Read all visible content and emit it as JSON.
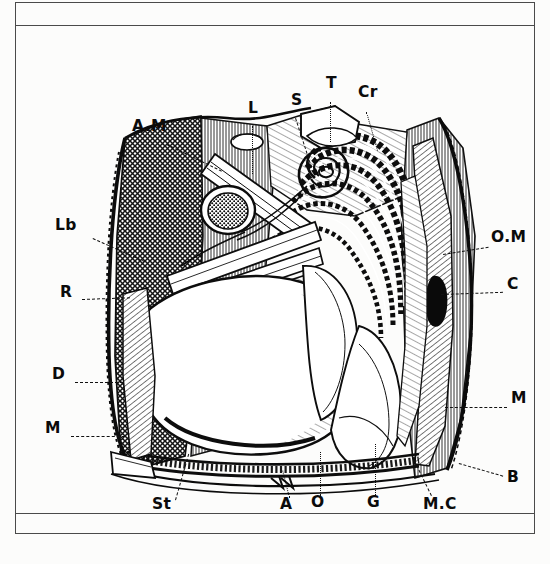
{
  "page": {
    "kind": "scanned-plate",
    "background_color": "#fcfcfb",
    "ink_color": "#111111",
    "rule_color": "#4a4a4a"
  },
  "figure": {
    "title": "",
    "caption": "",
    "style": "black-and-white line engraving with cross-hatching"
  },
  "labels": [
    {
      "id": "AM",
      "text": "A.M",
      "x": 117,
      "y": 100,
      "lx": 152,
      "ly": 118,
      "tx": 203,
      "ty": 148
    },
    {
      "id": "L",
      "text": "L",
      "x": 233,
      "y": 82,
      "lx": 238,
      "ly": 100,
      "tx": 238,
      "ty": 148
    },
    {
      "id": "S",
      "text": "S",
      "x": 276,
      "y": 74,
      "lx": 281,
      "ly": 92,
      "tx": 293,
      "ty": 142
    },
    {
      "id": "T",
      "text": "T",
      "x": 311,
      "y": 57,
      "lx": 316,
      "ly": 76,
      "tx": 316,
      "ty": 116
    },
    {
      "id": "Cr",
      "text": "Cr",
      "x": 344,
      "y": 66,
      "lx": 352,
      "ly": 86,
      "tx": 362,
      "ty": 124
    },
    {
      "id": "Lb",
      "text": "Lb",
      "x": 45,
      "y": 199,
      "lx": 78,
      "ly": 212,
      "tx": 133,
      "ty": 235
    },
    {
      "id": "R",
      "text": "R",
      "x": 49,
      "y": 266,
      "lx": 67,
      "ly": 275,
      "tx": 115,
      "ty": 272
    },
    {
      "id": "D",
      "text": "D",
      "x": 41,
      "y": 347,
      "lx": 60,
      "ly": 356,
      "tx": 108,
      "ty": 356
    },
    {
      "id": "M_L",
      "text": "M",
      "x": 33,
      "y": 401,
      "lx": 56,
      "ly": 410,
      "tx": 110,
      "ty": 410
    },
    {
      "id": "OM",
      "text": "O.M",
      "x": 478,
      "y": 212,
      "lx": 430,
      "ly": 228,
      "tx": 473,
      "ty": 221
    },
    {
      "id": "C",
      "text": "C",
      "x": 494,
      "y": 258,
      "lx": 428,
      "ly": 268,
      "tx": 489,
      "ty": 266
    },
    {
      "id": "M_R",
      "text": "M",
      "x": 498,
      "y": 372,
      "lx": 432,
      "ly": 381,
      "tx": 493,
      "ty": 381
    },
    {
      "id": "B",
      "text": "B",
      "x": 494,
      "y": 451,
      "lx": 447,
      "ly": 437,
      "tx": 489,
      "ly2": 0,
      "ty": 450
    },
    {
      "id": "St",
      "text": "St",
      "x": 141,
      "y": 479,
      "lx": 160,
      "ly": 474,
      "tx": 182,
      "ty": 428
    },
    {
      "id": "A",
      "text": "A",
      "x": 268,
      "y": 479,
      "lx": 274,
      "ly": 472,
      "tx": 268,
      "ty": 446
    },
    {
      "id": "O",
      "text": "O",
      "x": 299,
      "y": 477,
      "lx": 305,
      "ly": 470,
      "tx": 305,
      "ty": 427
    },
    {
      "id": "G",
      "text": "G",
      "x": 354,
      "y": 477,
      "lx": 360,
      "ly": 470,
      "tx": 360,
      "ty": 420
    },
    {
      "id": "MC",
      "text": "M.C",
      "x": 411,
      "y": 479,
      "lx": 418,
      "ly": 470,
      "tx": 398,
      "ty": 432
    }
  ],
  "legend_keys": {
    "AM": "A.M",
    "L": "L",
    "S": "S",
    "T": "T",
    "Cr": "Cr",
    "Lb": "Lb",
    "R": "R",
    "D": "D",
    "M_left": "M",
    "OM": "O.M",
    "C": "C",
    "M_right": "M",
    "B": "B",
    "St": "St",
    "A": "A",
    "O": "O",
    "G": "G",
    "MC": "M.C"
  }
}
